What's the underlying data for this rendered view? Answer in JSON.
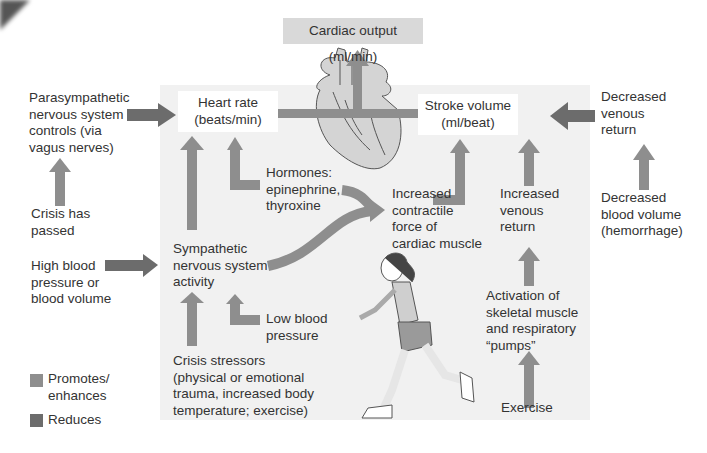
{
  "colors": {
    "promotes": "#8e8e8e",
    "reduces": "#6c6c6c",
    "panel": "#f1f1f1",
    "cardiac_output_box": "#d9d9d9"
  },
  "nodes": {
    "cardiac_output": "Cardiac output (ml/min)",
    "heart_rate": "Heart rate\n(beats/min)",
    "stroke_volume": "Stroke volume\n(ml/beat)",
    "parasympathetic": "Parasympathetic\nnervous system\ncontrols (via\nvagus nerves)",
    "crisis_passed": "Crisis has\npassed",
    "high_bp": "High blood\npressure or\nblood volume",
    "sympathetic": "Sympathetic\nnervous system\nactivity",
    "hormones": "Hormones:\nepinephrine,\nthyroxine",
    "low_bp": "Low blood\npressure",
    "crisis_stressors": "Crisis stressors\n(physical or emotional\ntrauma, increased body\ntemperature; exercise)",
    "contractile_force": "Increased\ncontractile\nforce of\ncardiac muscle",
    "increased_venous": "Increased\nvenous\nreturn",
    "activation_pumps": "Activation of\nskeletal muscle\nand respiratory\n“pumps”",
    "exercise": "Exercise",
    "decreased_venous": "Decreased\nvenous\nreturn",
    "decreased_volume": "Decreased\nblood volume\n(hemorrhage)"
  },
  "legend": {
    "promotes": "Promotes/\nenhances",
    "reduces": "Reduces"
  },
  "edges": [
    {
      "from": "parasympathetic",
      "to": "heart_rate",
      "type": "reduces"
    },
    {
      "from": "crisis_passed",
      "to": "parasympathetic",
      "type": "promotes"
    },
    {
      "from": "high_bp",
      "to": "sympathetic",
      "type": "reduces"
    },
    {
      "from": "sympathetic",
      "to": "heart_rate",
      "type": "promotes"
    },
    {
      "from": "hormones",
      "to": "heart_rate",
      "type": "promotes"
    },
    {
      "from": "hormones",
      "to": "contractile_force",
      "type": "promotes"
    },
    {
      "from": "sympathetic",
      "to": "contractile_force",
      "type": "promotes"
    },
    {
      "from": "crisis_stressors",
      "to": "sympathetic",
      "type": "promotes"
    },
    {
      "from": "low_bp",
      "to": "sympathetic",
      "type": "promotes"
    },
    {
      "from": "contractile_force",
      "to": "stroke_volume",
      "type": "promotes"
    },
    {
      "from": "increased_venous",
      "to": "stroke_volume",
      "type": "promotes"
    },
    {
      "from": "activation_pumps",
      "to": "increased_venous",
      "type": "promotes"
    },
    {
      "from": "exercise",
      "to": "activation_pumps",
      "type": "promotes"
    },
    {
      "from": "decreased_venous",
      "to": "stroke_volume",
      "type": "reduces"
    },
    {
      "from": "decreased_volume",
      "to": "decreased_venous",
      "type": "promotes"
    },
    {
      "from": "heart_rate",
      "to": "cardiac_output",
      "type": "promotes"
    },
    {
      "from": "stroke_volume",
      "to": "cardiac_output",
      "type": "promotes"
    }
  ]
}
